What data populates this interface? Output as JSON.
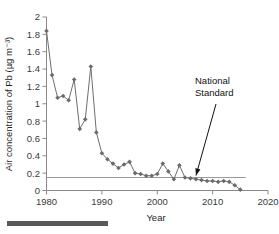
{
  "figure": {
    "caption_rule_name": "caption-rule"
  },
  "chart_data": {
    "type": "line",
    "title": "",
    "xlabel": "Year",
    "ylabel": "Air concentration of Pb (µg m⁻³)",
    "xlim": [
      1980,
      2020
    ],
    "ylim": [
      0,
      2
    ],
    "xticks": [
      1980,
      1990,
      2000,
      2010,
      2020
    ],
    "xtick_labels": [
      "1980",
      "1990",
      "2000",
      "2010",
      "2020"
    ],
    "yticks": [
      0,
      0.2,
      0.4,
      0.6,
      0.8,
      1,
      1.2,
      1.4,
      1.6,
      1.8,
      2
    ],
    "ytick_labels": [
      "0",
      "0.2",
      "0.4",
      "0.6",
      "0.8",
      "1",
      "1.2",
      "1.4",
      "1.6",
      "1.8",
      "2"
    ],
    "grid": false,
    "legend": null,
    "marker": "diamond",
    "line_color": "#6e6e6e",
    "marker_color": "#6b6b6b",
    "x": [
      1980,
      1981,
      1982,
      1983,
      1984,
      1985,
      1986,
      1987,
      1988,
      1989,
      1990,
      1991,
      1992,
      1993,
      1994,
      1995,
      1996,
      1997,
      1998,
      1999,
      2000,
      2001,
      2002,
      2003,
      2004,
      2005,
      2006,
      2007,
      2008,
      2009,
      2010,
      2011,
      2012,
      2013,
      2014,
      2015
    ],
    "values": [
      1.84,
      1.33,
      1.07,
      1.09,
      1.04,
      1.28,
      0.71,
      0.82,
      1.43,
      0.67,
      0.43,
      0.36,
      0.31,
      0.26,
      0.3,
      0.33,
      0.2,
      0.19,
      0.17,
      0.17,
      0.19,
      0.31,
      0.22,
      0.13,
      0.29,
      0.15,
      0.14,
      0.13,
      0.12,
      0.11,
      0.11,
      0.1,
      0.11,
      0.1,
      0.06,
      0.01
    ],
    "series": [
      {
        "name": "Air concentration of Pb",
        "values": [
          1.84,
          1.33,
          1.07,
          1.09,
          1.04,
          1.28,
          0.71,
          0.82,
          1.43,
          0.67,
          0.43,
          0.36,
          0.31,
          0.26,
          0.3,
          0.33,
          0.2,
          0.19,
          0.17,
          0.17,
          0.19,
          0.31,
          0.22,
          0.13,
          0.29,
          0.15,
          0.14,
          0.13,
          0.12,
          0.11,
          0.11,
          0.1,
          0.11,
          0.1,
          0.06,
          0.01
        ]
      }
    ],
    "reference_lines": [
      {
        "label": "National Standard",
        "value": 0.15,
        "orientation": "horizontal",
        "x_start": 1980,
        "x_end": 2016,
        "color": "#9a9a9a"
      }
    ],
    "annotations": [
      {
        "text_line_1": "National",
        "text_line_2": "Standard",
        "target_x": 2007,
        "target_y": 0.15
      }
    ]
  }
}
